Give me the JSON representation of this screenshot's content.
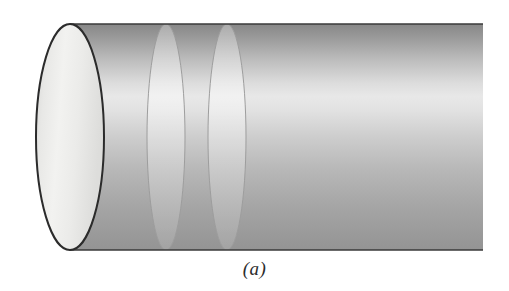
{
  "figure": {
    "caption": "(a)",
    "kind": "cylinder-diagram",
    "canvas": {
      "width": 509,
      "height": 291,
      "background": "#ffffff"
    }
  },
  "colors": {
    "outline": "#2b2b2b",
    "cross_section_line": "#9a9a9a",
    "body_top": "#8e8e8e",
    "body_highlight": "#e6e6e6",
    "body_bottom": "#909090",
    "cap_light": "#f0f0ee",
    "cap_mid": "#e2e2e0",
    "cap_edge": "#cfcfcd"
  },
  "geometry": {
    "body": {
      "left_x": 70,
      "right_x": 483,
      "top_y": 24,
      "bottom_y": 250
    },
    "cap_ellipse": {
      "cx": 70,
      "cy": 137,
      "rx": 34,
      "ry": 113,
      "stroke_width": 2
    },
    "cross_sections": [
      {
        "cx": 166,
        "cy": 137,
        "rx": 19,
        "ry": 113,
        "stroke_width": 1
      },
      {
        "cx": 227,
        "cy": 137,
        "rx": 19,
        "ry": 113,
        "stroke_width": 1
      }
    ]
  },
  "labels": {
    "cylinder_body": "cylinder body",
    "cap": "cylinder left end cap",
    "cross_section_a": "cross-section ellipse 1",
    "cross_section_b": "cross-section ellipse 2"
  }
}
